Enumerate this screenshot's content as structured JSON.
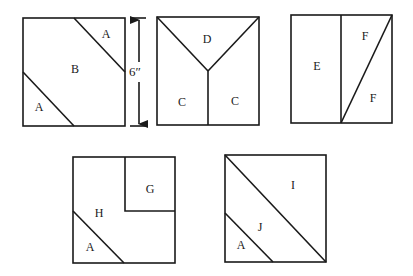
{
  "diagram": {
    "dimension": {
      "label": "6″",
      "applies_to": "block side length"
    },
    "blocks": [
      {
        "id": "block-1",
        "pieces": [
          "A",
          "B",
          "A"
        ]
      },
      {
        "id": "block-2",
        "pieces": [
          "D",
          "C",
          "C"
        ]
      },
      {
        "id": "block-3",
        "pieces": [
          "E",
          "F",
          "F"
        ]
      },
      {
        "id": "block-4",
        "pieces": [
          "G",
          "H",
          "A"
        ]
      },
      {
        "id": "block-5",
        "pieces": [
          "I",
          "J",
          "A"
        ]
      }
    ],
    "labels": {
      "b1_a_top": "A",
      "b1_b": "B",
      "b1_a_bottom": "A",
      "b2_d": "D",
      "b2_c_left": "C",
      "b2_c_right": "C",
      "b3_e": "E",
      "b3_f_top": "F",
      "b3_f_bottom": "F",
      "b4_g": "G",
      "b4_h": "H",
      "b4_a": "A",
      "b5_i": "I",
      "b5_j": "J",
      "b5_a": "A"
    },
    "colors": {
      "line": "#1a1a1a",
      "background": "#ffffff"
    }
  }
}
